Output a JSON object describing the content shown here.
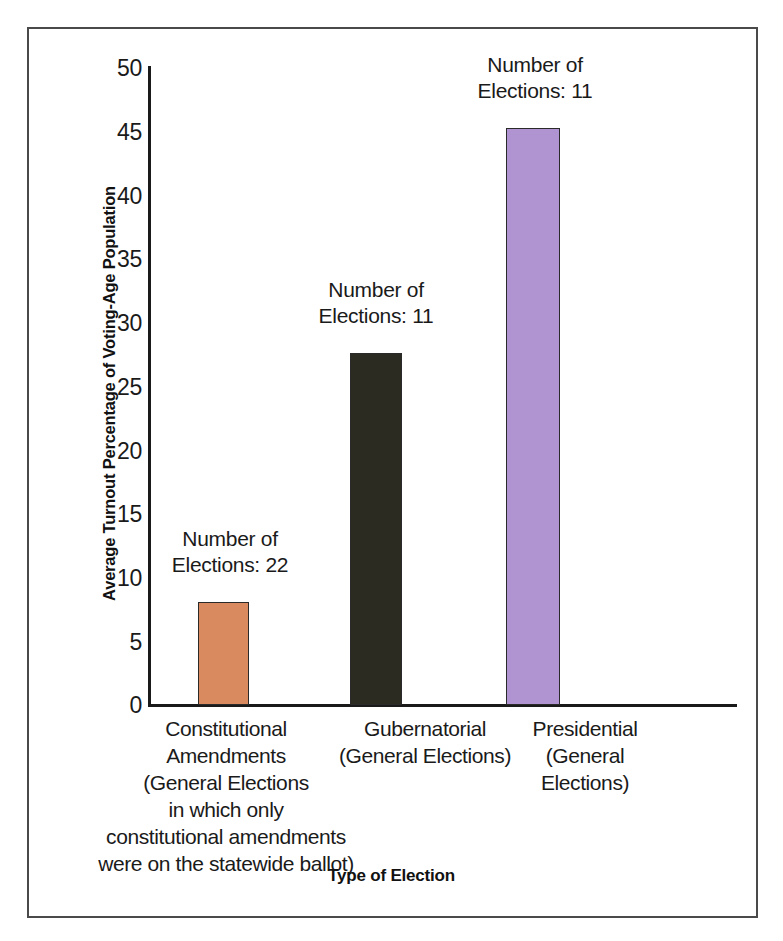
{
  "chart_data": {
    "type": "bar",
    "title": "",
    "xlabel": "Type of Election",
    "ylabel": "Average Turnout Percentage of Voting-Age Population",
    "ylim": [
      0,
      50
    ],
    "ytick_step": 5,
    "yticks": [
      "50",
      "45",
      "40",
      "35",
      "30",
      "25",
      "20",
      "15",
      "10",
      "5",
      "0"
    ],
    "grid": false,
    "legend": "none",
    "categories": [
      "Constitutional\nAmendments\n(General Elections\nin which only\nconstitutional amendments\nwere on the statewide ballot)",
      "Gubernatorial\n(General Elections)",
      "Presidential\n(General\nElections)"
    ],
    "values": [
      8.1,
      27.6,
      45.3
    ],
    "bar_colors": [
      "#D98A5E",
      "#2B2B22",
      "#AF94D1"
    ],
    "annotations": [
      "Number of\nElections: 22",
      "Number of\nElections: 11",
      "Number of\nElections: 11"
    ],
    "annotation_counts": [
      22,
      11,
      11
    ]
  },
  "axis": {
    "y_title": "Average Turnout Percentage of Voting-Age Population",
    "x_title": "Type of Election"
  },
  "ticks": {
    "t50": "50",
    "t45": "45",
    "t40": "40",
    "t35": "35",
    "t30": "30",
    "t25": "25",
    "t20": "20",
    "t15": "15",
    "t10": "10",
    "t5": "5",
    "t0": "0"
  },
  "bars": [
    {
      "name": "constitutional-amendments",
      "label": "Constitutional\nAmendments\n(General Elections\nin which only\nconstitutional amendments\nwere on the statewide ballot)",
      "note": "Number of\nElections: 22",
      "value": 8.1,
      "color": "#D98A5E"
    },
    {
      "name": "gubernatorial",
      "label": "Gubernatorial\n(General Elections)",
      "note": "Number of\nElections: 11",
      "value": 27.6,
      "color": "#2B2B22"
    },
    {
      "name": "presidential",
      "label": "Presidential\n(General\nElections)",
      "note": "Number of\nElections: 11",
      "value": 45.3,
      "color": "#AF94D1"
    }
  ]
}
